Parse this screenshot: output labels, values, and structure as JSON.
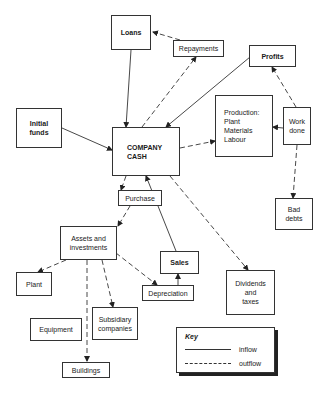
{
  "diagram": {
    "nodes": {
      "loans": {
        "label": "Loans",
        "emphasis": "bold"
      },
      "repayments": {
        "label": "Repayments"
      },
      "profits": {
        "label": "Profits",
        "emphasis": "bold"
      },
      "initial_funds": {
        "label": "Initial\nfunds",
        "emphasis": "bold"
      },
      "company_cash": {
        "label": "COMPANY\nCASH",
        "emphasis": "bold"
      },
      "production": {
        "label": "Production:\n   Plant\n   Materials\n   Labour"
      },
      "work_done": {
        "label": "Work\ndone"
      },
      "bad_debts": {
        "label": "Bad\ndebts"
      },
      "purchase": {
        "label": "Purchase"
      },
      "assets": {
        "label": "Assets and\ninvestments"
      },
      "plant": {
        "label": "Plant"
      },
      "sales": {
        "label": "Sales",
        "emphasis": "bold"
      },
      "depreciation": {
        "label": "Depreciation"
      },
      "dividends": {
        "label": "Dividends\nand\ntaxes"
      },
      "subsidiary": {
        "label": "Subsidiary\ncompanies"
      },
      "equipment": {
        "label": "Equipment"
      },
      "buildings": {
        "label": "Buildings"
      }
    },
    "edges": [
      {
        "from": "loans",
        "to": "company_cash",
        "type": "inflow"
      },
      {
        "from": "repayments",
        "to": "loans",
        "type": "outflow"
      },
      {
        "from": "company_cash",
        "to": "repayments",
        "type": "outflow"
      },
      {
        "from": "profits",
        "to": "company_cash",
        "type": "inflow"
      },
      {
        "from": "initial_funds",
        "to": "company_cash",
        "type": "inflow"
      },
      {
        "from": "company_cash",
        "to": "production",
        "type": "outflow"
      },
      {
        "from": "work_done",
        "to": "production",
        "type": "outflow"
      },
      {
        "from": "work_done",
        "to": "profits",
        "type": "outflow"
      },
      {
        "from": "work_done",
        "to": "bad_debts",
        "type": "outflow"
      },
      {
        "from": "company_cash",
        "to": "purchase",
        "type": "outflow"
      },
      {
        "from": "purchase",
        "to": "assets",
        "type": "outflow"
      },
      {
        "from": "assets",
        "to": "plant",
        "type": "outflow"
      },
      {
        "from": "assets",
        "to": "subsidiary",
        "type": "outflow"
      },
      {
        "from": "assets",
        "to": "buildings",
        "type": "outflow"
      },
      {
        "from": "assets",
        "to": "depreciation",
        "type": "outflow"
      },
      {
        "from": "depreciation",
        "to": "sales",
        "type": "inflow"
      },
      {
        "from": "sales",
        "to": "company_cash",
        "type": "inflow"
      },
      {
        "from": "company_cash",
        "to": "dividends",
        "type": "outflow"
      }
    ]
  },
  "key": {
    "title": "Key",
    "inflow_label": "inflow",
    "outflow_label": "outflow"
  }
}
